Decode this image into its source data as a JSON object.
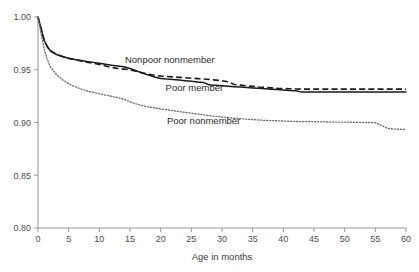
{
  "chart_data": {
    "type": "line",
    "title": "",
    "subtitle": "",
    "xlabel": "Age in months",
    "ylabel": "",
    "xlim": [
      0,
      60
    ],
    "ylim": [
      0.8,
      1.0
    ],
    "grid": false,
    "legend_position": "inline-annotations",
    "xticks": [
      0,
      5,
      10,
      15,
      20,
      25,
      30,
      35,
      40,
      45,
      50,
      55,
      60
    ],
    "xtick_labels": [
      "0",
      "5",
      "10",
      "15",
      "20",
      "25",
      "30",
      "35",
      "40",
      "45",
      "50",
      "55",
      "60"
    ],
    "yticks": [
      0.8,
      0.85,
      0.9,
      0.95,
      1.0
    ],
    "ytick_labels": [
      "0.80",
      "0.85",
      "0.90",
      "0.95",
      "1.00"
    ],
    "x": [
      0,
      0.5,
      1,
      1.5,
      2,
      3,
      4,
      5,
      6,
      7,
      8,
      9,
      10,
      11,
      12,
      13,
      14,
      15,
      16,
      17,
      18,
      19,
      20,
      21,
      22,
      23,
      24,
      25,
      26,
      27,
      28,
      29,
      30,
      31,
      32,
      33,
      34,
      35,
      36,
      37,
      38,
      39,
      40,
      41,
      42,
      43,
      44,
      45,
      46,
      48,
      50,
      52,
      54,
      55,
      56,
      57,
      58,
      59,
      60
    ],
    "series": [
      {
        "name": "Poor member",
        "style": "solid",
        "color": "#1a1a1a",
        "values": [
          1.0,
          0.989,
          0.978,
          0.972,
          0.968,
          0.9645,
          0.9625,
          0.961,
          0.9598,
          0.9588,
          0.9578,
          0.957,
          0.9562,
          0.9552,
          0.9542,
          0.9535,
          0.9528,
          0.9512,
          0.949,
          0.9468,
          0.945,
          0.9432,
          0.9418,
          0.9412,
          0.9408,
          0.9402,
          0.9396,
          0.939,
          0.9384,
          0.9378,
          0.9356,
          0.9352,
          0.9348,
          0.9344,
          0.934,
          0.9336,
          0.9332,
          0.9328,
          0.9324,
          0.932,
          0.9316,
          0.9312,
          0.9308,
          0.9304,
          0.93,
          0.9288,
          0.9288,
          0.9288,
          0.9288,
          0.9288,
          0.9288,
          0.9288,
          0.9288,
          0.9288,
          0.9288,
          0.9288,
          0.9288,
          0.9288,
          0.9288
        ]
      },
      {
        "name": "Nonpoor nonmember",
        "style": "dashed",
        "color": "#1a1a1a",
        "values": [
          1.0,
          0.989,
          0.978,
          0.972,
          0.968,
          0.9645,
          0.9625,
          0.9608,
          0.9596,
          0.9584,
          0.9572,
          0.9562,
          0.955,
          0.9536,
          0.9522,
          0.9512,
          0.9506,
          0.95,
          0.9486,
          0.9472,
          0.9458,
          0.9448,
          0.944,
          0.9436,
          0.9432,
          0.9428,
          0.9424,
          0.942,
          0.9416,
          0.9412,
          0.9408,
          0.9402,
          0.9396,
          0.9386,
          0.936,
          0.9354,
          0.9348,
          0.9342,
          0.9336,
          0.9332,
          0.9328,
          0.9324,
          0.9322,
          0.932,
          0.9318,
          0.9316,
          0.9316,
          0.9316,
          0.9316,
          0.9316,
          0.9316,
          0.9316,
          0.9316,
          0.9316,
          0.9316,
          0.9316,
          0.9316,
          0.9316,
          0.9316
        ]
      },
      {
        "name": "Poor nonmember",
        "style": "dotted",
        "color": "#6e6e6e",
        "values": [
          1.0,
          0.984,
          0.97,
          0.96,
          0.953,
          0.9455,
          0.9405,
          0.9368,
          0.934,
          0.9318,
          0.93,
          0.9285,
          0.9272,
          0.926,
          0.9248,
          0.9236,
          0.922,
          0.9196,
          0.9176,
          0.916,
          0.9148,
          0.9138,
          0.9128,
          0.912,
          0.9112,
          0.9104,
          0.9096,
          0.9088,
          0.908,
          0.9072,
          0.9064,
          0.9058,
          0.9052,
          0.9046,
          0.904,
          0.9036,
          0.9032,
          0.9028,
          0.9024,
          0.902,
          0.9018,
          0.9016,
          0.9014,
          0.9012,
          0.901,
          0.9008,
          0.9008,
          0.9008,
          0.9006,
          0.9004,
          0.9004,
          0.9002,
          0.9,
          0.8998,
          0.8972,
          0.8946,
          0.8938,
          0.8936,
          0.8934
        ]
      }
    ],
    "annotations": [
      {
        "text": "Nonpoor nonmember",
        "x": 21.5,
        "y": 0.9565
      },
      {
        "text": "Poor member",
        "x": 25.5,
        "y": 0.93
      },
      {
        "text": "Poor nonmember",
        "x": 27.0,
        "y": 0.899
      }
    ]
  }
}
